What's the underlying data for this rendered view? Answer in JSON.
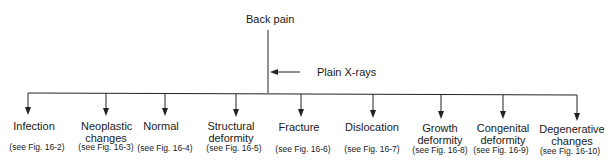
{
  "diagram": {
    "root": "Back pain",
    "step": "Plain X-rays",
    "children": [
      {
        "label": "Infection",
        "ref": "(see Fig. 16-2)"
      },
      {
        "label": "Neoplastic changes",
        "ref": "(see Fig. 16-3)"
      },
      {
        "label": "Normal",
        "ref": "(see Fig. 16-4)"
      },
      {
        "label": "Structural deformity",
        "ref": "(see Fig. 16-5)"
      },
      {
        "label": "Fracture",
        "ref": "(see Fig. 16-6)"
      },
      {
        "label": "Dislocation",
        "ref": "(see Fig. 16-7)"
      },
      {
        "label": "Growth deformity",
        "ref": "(see Fig. 16-8)"
      },
      {
        "label": "Congenital deformity",
        "ref": "(see Fig. 16-9)"
      },
      {
        "label": "Degenerative changes",
        "ref": "(see Fig. 16-10)"
      }
    ]
  }
}
